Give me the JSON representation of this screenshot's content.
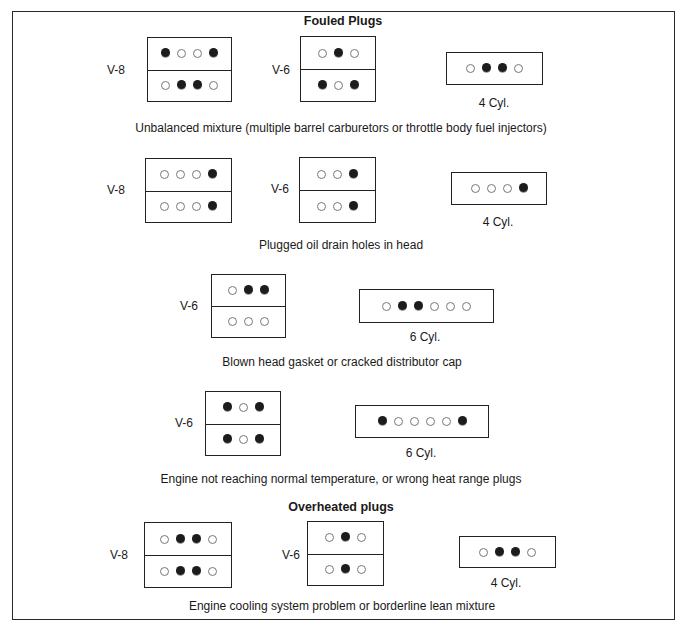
{
  "figure": {
    "heading_fouled": "Fouled Plugs",
    "heading_overheated": "Overheated plugs",
    "clipped_footer": ""
  },
  "legend_meaning": {
    "filled": "affected plug",
    "open": "normal plug"
  },
  "rows": [
    {
      "caption": "Unbalanced mixture (multiple barrel carburetors or throttle body fuel injectors)",
      "engines": [
        {
          "type": "V-8",
          "label": "V-8",
          "banks": [
            [
              1,
              0,
              0,
              1
            ],
            [
              0,
              1,
              1,
              0
            ]
          ]
        },
        {
          "type": "V-6",
          "label": "V-6",
          "banks": [
            [
              0,
              1,
              0
            ],
            [
              1,
              0,
              1
            ]
          ]
        },
        {
          "type": "4 Cyl.",
          "label": "4 Cyl.",
          "banks": [
            [
              0,
              1,
              1,
              0
            ]
          ]
        }
      ]
    },
    {
      "caption": "Plugged oil drain holes in head",
      "engines": [
        {
          "type": "V-8",
          "label": "V-8",
          "banks": [
            [
              0,
              0,
              0,
              1
            ],
            [
              0,
              0,
              0,
              1
            ]
          ]
        },
        {
          "type": "V-6",
          "label": "V-6",
          "banks": [
            [
              0,
              0,
              1
            ],
            [
              0,
              0,
              1
            ]
          ]
        },
        {
          "type": "4 Cyl.",
          "label": "4 Cyl.",
          "banks": [
            [
              0,
              0,
              0,
              1
            ]
          ]
        }
      ]
    },
    {
      "caption": "Blown head gasket or cracked distributor cap",
      "engines": [
        {
          "type": "V-6",
          "label": "V-6",
          "banks": [
            [
              0,
              1,
              1
            ],
            [
              0,
              0,
              0
            ]
          ]
        },
        {
          "type": "6 Cyl.",
          "label": "6 Cyl.",
          "banks": [
            [
              0,
              1,
              1,
              0,
              0,
              0
            ]
          ]
        }
      ]
    },
    {
      "caption": "Engine not reaching normal temperature, or wrong heat range plugs",
      "engines": [
        {
          "type": "V-6",
          "label": "V-6",
          "banks": [
            [
              1,
              0,
              1
            ],
            [
              1,
              0,
              1
            ]
          ]
        },
        {
          "type": "6 Cyl.",
          "label": "6 Cyl.",
          "banks": [
            [
              1,
              0,
              0,
              0,
              0,
              1
            ]
          ]
        }
      ]
    },
    {
      "caption": "Engine cooling system problem or borderline lean mixture",
      "engines": [
        {
          "type": "V-8",
          "label": "V-8",
          "banks": [
            [
              0,
              1,
              1,
              0
            ],
            [
              0,
              1,
              1,
              0
            ]
          ]
        },
        {
          "type": "V-6",
          "label": "V-6",
          "banks": [
            [
              0,
              1,
              0
            ],
            [
              0,
              1,
              0
            ]
          ]
        },
        {
          "type": "4 Cyl.",
          "label": "4 Cyl.",
          "banks": [
            [
              0,
              1,
              1,
              0
            ]
          ]
        }
      ]
    }
  ]
}
